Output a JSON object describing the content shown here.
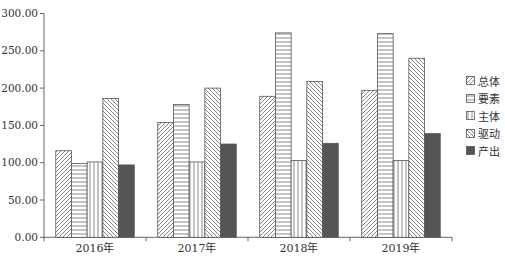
{
  "chart_data": {
    "type": "bar",
    "title": "",
    "xlabel": "",
    "ylabel": "",
    "categories": [
      "2016年",
      "2017年",
      "2018年",
      "2019年"
    ],
    "series": [
      {
        "name": "总体",
        "pattern": "diag-forward",
        "values": [
          116.0,
          154.0,
          189.0,
          197.0
        ]
      },
      {
        "name": "要素",
        "pattern": "horizontal",
        "values": [
          99.0,
          178.0,
          274.0,
          273.0
        ]
      },
      {
        "name": "主体",
        "pattern": "vertical",
        "values": [
          101.0,
          101.0,
          103.0,
          103.0
        ]
      },
      {
        "name": "驱动",
        "pattern": "diag-backward",
        "values": [
          186.0,
          200.0,
          209.0,
          240.0
        ]
      },
      {
        "name": "产出",
        "pattern": "solid",
        "values": [
          97.0,
          125.0,
          126.0,
          139.0
        ]
      }
    ],
    "ylim": [
      0,
      300
    ],
    "yticks": [
      "0.00",
      "50.00",
      "100.00",
      "150.00",
      "200.00",
      "250.00",
      "300.00"
    ],
    "grid": false,
    "legend_position": "right",
    "colors": {
      "line": "#555555",
      "solid_fill": "#555555",
      "axis": "#666666"
    }
  }
}
